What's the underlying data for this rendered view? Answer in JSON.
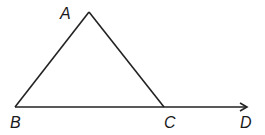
{
  "diagram": {
    "type": "geometry-triangle-exterior-angle",
    "stroke_color": "#222222",
    "points": {
      "A": {
        "x": 89,
        "y": 12
      },
      "B": {
        "x": 15,
        "y": 107
      },
      "C": {
        "x": 164,
        "y": 107
      },
      "D": {
        "x": 247,
        "y": 107
      }
    },
    "segments": [
      {
        "from": "A",
        "to": "B"
      },
      {
        "from": "A",
        "to": "C"
      },
      {
        "from": "B",
        "to": "C"
      }
    ],
    "rays": [
      {
        "from": "C",
        "to": "D",
        "arrow": true
      }
    ],
    "labels": {
      "A": "A",
      "B": "B",
      "C": "C",
      "D": "D"
    }
  }
}
